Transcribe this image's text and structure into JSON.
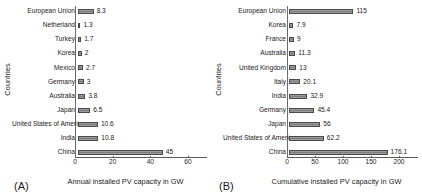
{
  "figure": {
    "panels": [
      {
        "panel_label": "(A)",
        "ylabel": "Countries",
        "xlabel": "Annual installed PV capacity in GW"
      },
      {
        "panel_label": "(B)",
        "ylabel": "Countries",
        "xlabel": "Cumulative installed PV capacity in GW"
      }
    ]
  },
  "chart_data": [
    {
      "type": "bar",
      "orientation": "horizontal",
      "panel": "(A)",
      "title": "",
      "xlabel": "Annual installed PV capacity in GW",
      "ylabel": "Countries",
      "xlim": [
        0,
        60
      ],
      "xticks": [
        0,
        20,
        40,
        60
      ],
      "grid": false,
      "legend": false,
      "categories": [
        "European Union",
        "Netherland",
        "Turkey",
        "Korea",
        "Mexico",
        "Germany",
        "Australia",
        "Japan",
        "United States of America",
        "India",
        "China"
      ],
      "values": [
        8.3,
        1.3,
        1.7,
        2,
        2.7,
        3,
        3.8,
        6.5,
        10.6,
        10.8,
        45
      ],
      "value_labels": [
        "8.3",
        "1.3",
        "1.7",
        "2",
        "2.7",
        "3",
        "3.8",
        "6.5",
        "10.6",
        "10.8",
        "45"
      ]
    },
    {
      "type": "bar",
      "orientation": "horizontal",
      "panel": "(B)",
      "title": "",
      "xlabel": "Cumulative installed PV capacity in GW",
      "ylabel": "Countries",
      "xlim": [
        0,
        200
      ],
      "xticks": [
        0,
        50,
        100,
        150,
        200
      ],
      "grid": false,
      "legend": false,
      "categories": [
        "European Union",
        "Korea",
        "France",
        "Australia",
        "United Kingdom",
        "Italy",
        "India",
        "Germany",
        "Japan",
        "United States of America",
        "China"
      ],
      "values": [
        115,
        7.9,
        9,
        11.3,
        13,
        20.1,
        32.9,
        45.4,
        56,
        62.2,
        176.1
      ],
      "value_labels": [
        "115",
        "7.9",
        "9",
        "11.3",
        "13",
        "20.1",
        "32.9",
        "45.4",
        "56",
        "62.2",
        "176.1"
      ]
    }
  ],
  "colors": {
    "bar_fill": "#8a8a8a",
    "bar_edge": "#4a4a4a",
    "axis": "#5a5a5a",
    "text": "#1a1a1a",
    "background": "#ffffff"
  }
}
